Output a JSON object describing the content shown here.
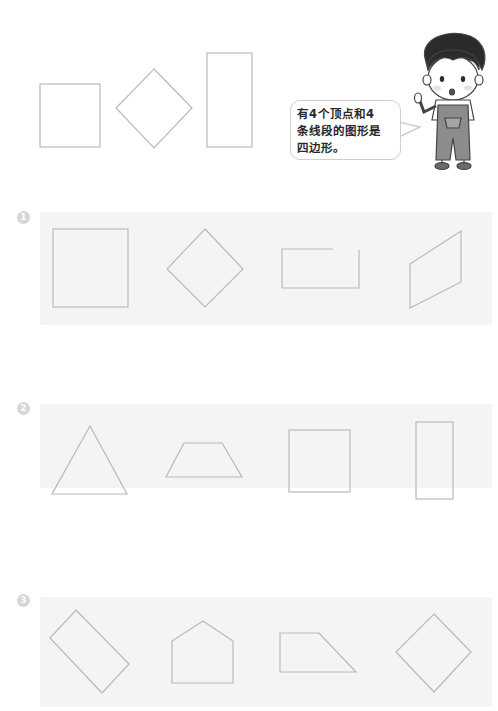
{
  "intro": {
    "speech_bubble": "有4个顶点和4\n条线段的图形是\n四边形。",
    "character": "boy-pointing-icon",
    "example_shapes": [
      "square",
      "diamond",
      "tall-rectangle"
    ]
  },
  "exercises": [
    {
      "number": "1",
      "shapes": [
        "square",
        "diamond",
        "open-rectangle",
        "parallelogram"
      ]
    },
    {
      "number": "2",
      "shapes": [
        "triangle",
        "trapezoid",
        "square",
        "tall-rectangle"
      ]
    },
    {
      "number": "3",
      "shapes": [
        "rotated-rectangle",
        "pentagon",
        "right-trapezoid",
        "diamond"
      ]
    }
  ],
  "colors": {
    "shape_stroke": "#b9b9b9",
    "band_background": "#f4f4f4",
    "badge": "#d6d6d6"
  }
}
